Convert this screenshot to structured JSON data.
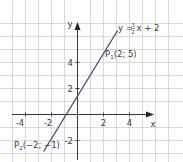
{
  "diagram": {
    "type": "coordinate-plot",
    "axes": {
      "x_label": "x",
      "y_label": "y",
      "x_ticks": [
        "-4",
        "-2",
        "2",
        "4"
      ],
      "y_ticks": [
        "4",
        "2",
        "-2"
      ],
      "grid_unit": 1,
      "colors": {
        "grid": "#c8c8c8",
        "axis": "#222222",
        "line": "#3f4a7a",
        "text": "#3a3a3a"
      }
    },
    "line": {
      "equation_prefix": "y = ",
      "equation_num": "3",
      "equation_den": "2",
      "equation_suffix": "x + 2",
      "slope": 1.5,
      "intercept": 2
    },
    "points": [
      {
        "name": "P",
        "sub": "1",
        "coords": "(2; 5)",
        "x": 2,
        "y": 5
      },
      {
        "name": "P",
        "sub": "2",
        "coords": "(−2; −1)",
        "x": -2,
        "y": -1
      }
    ]
  }
}
